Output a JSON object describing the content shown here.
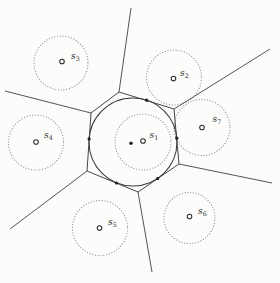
{
  "diagram": {
    "background": "#fcfcfb",
    "edge_color": "#424242",
    "dotted_circle_color": "#8c8c8c",
    "cell": {
      "vertices": [
        [
          119,
          92
        ],
        [
          174,
          109
        ],
        [
          179,
          164
        ],
        [
          138,
          192
        ],
        [
          87,
          171
        ],
        [
          91,
          113
        ]
      ]
    },
    "rays": [
      {
        "name": "ray-top",
        "from": [
          119,
          92
        ],
        "to": [
          131,
          8
        ]
      },
      {
        "name": "ray-upper-right",
        "from": [
          174,
          109
        ],
        "to": [
          270,
          49
        ]
      },
      {
        "name": "ray-right",
        "from": [
          179,
          164
        ],
        "to": [
          272,
          183
        ]
      },
      {
        "name": "ray-bottom",
        "from": [
          138,
          192
        ],
        "to": [
          152,
          272
        ]
      },
      {
        "name": "ray-lower-left",
        "from": [
          87,
          171
        ],
        "to": [
          10,
          229
        ]
      },
      {
        "name": "ray-left",
        "from": [
          91,
          113
        ],
        "to": [
          5,
          91
        ]
      }
    ],
    "inscribed_circle": {
      "cx": 133,
      "cy": 142,
      "r": 44
    },
    "center_dot": {
      "x": 131,
      "y": 143.2,
      "r": 1.7
    },
    "tangent_dots": [
      [
        146.6,
        100.2
      ],
      [
        176.8,
        138.2
      ],
      [
        157.6,
        178.5
      ],
      [
        116.5,
        183.0
      ],
      [
        89.1,
        138.9
      ]
    ],
    "sites": [
      {
        "id": "s1",
        "label_base": "s",
        "label_sub": "1",
        "marker": [
          143,
          141
        ],
        "marker_r": 2.3,
        "dotted_circle": {
          "cx": 143,
          "cy": 142,
          "r": 28
        },
        "label_pos": [
          149.5,
          138
        ]
      },
      {
        "id": "s2",
        "label_base": "s",
        "label_sub": "2",
        "marker": [
          173.5,
          78.5
        ],
        "marker_r": 2.3,
        "dotted_circle": {
          "cx": 174,
          "cy": 77.5,
          "r": 27.5
        },
        "label_pos": [
          180,
          76
        ]
      },
      {
        "id": "s3",
        "label_base": "s",
        "label_sub": "3",
        "marker": [
          62,
          61.5
        ],
        "marker_r": 2.3,
        "dotted_circle": {
          "cx": 61,
          "cy": 63,
          "r": 27
        },
        "label_pos": [
          71,
          59
        ]
      },
      {
        "id": "s4",
        "label_base": "s",
        "label_sub": "4",
        "marker": [
          36,
          142
        ],
        "marker_r": 2.3,
        "dotted_circle": {
          "cx": 36,
          "cy": 142.5,
          "r": 27.5
        },
        "label_pos": [
          44,
          138
        ]
      },
      {
        "id": "s5",
        "label_base": "s",
        "label_sub": "5",
        "marker": [
          99.5,
          228
        ],
        "marker_r": 2.3,
        "dotted_circle": {
          "cx": 100,
          "cy": 228,
          "r": 27.5
        },
        "label_pos": [
          108,
          225
        ]
      },
      {
        "id": "s6",
        "label_base": "s",
        "label_sub": "6",
        "marker": [
          189.5,
          216.5
        ],
        "marker_r": 2.3,
        "dotted_circle": {
          "cx": 189.5,
          "cy": 218,
          "r": 25.5
        },
        "label_pos": [
          198,
          214
        ]
      },
      {
        "id": "s7",
        "label_base": "s",
        "label_sub": "7",
        "marker": [
          202,
          127.5
        ],
        "marker_r": 2.3,
        "dotted_circle": {
          "cx": 202,
          "cy": 127.5,
          "r": 28
        },
        "label_pos": [
          212.5,
          122
        ]
      }
    ]
  }
}
